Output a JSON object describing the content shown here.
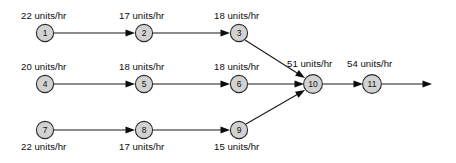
{
  "diagram": {
    "type": "process-flow-network",
    "unit_suffix": "units/hr",
    "nodes": [
      {
        "id": "n1",
        "label": "1",
        "cx": 45,
        "cy": 33,
        "r": 8.6
      },
      {
        "id": "n2",
        "label": "2",
        "cx": 144,
        "cy": 33,
        "r": 8.6
      },
      {
        "id": "n3",
        "label": "3",
        "cx": 239,
        "cy": 33,
        "r": 8.6
      },
      {
        "id": "n4",
        "label": "4",
        "cx": 45,
        "cy": 84,
        "r": 8.6
      },
      {
        "id": "n5",
        "label": "5",
        "cx": 144,
        "cy": 84,
        "r": 8.6
      },
      {
        "id": "n6",
        "label": "6",
        "cx": 239,
        "cy": 84,
        "r": 8.6
      },
      {
        "id": "n7",
        "label": "7",
        "cx": 45,
        "cy": 130,
        "r": 8.6
      },
      {
        "id": "n8",
        "label": "8",
        "cx": 144,
        "cy": 130,
        "r": 8.6
      },
      {
        "id": "n9",
        "label": "9",
        "cx": 239,
        "cy": 130,
        "r": 8.6
      },
      {
        "id": "n10",
        "label": "10",
        "cx": 313,
        "cy": 84,
        "r": 9.4
      },
      {
        "id": "n11",
        "label": "11",
        "cx": 372,
        "cy": 84,
        "r": 9.4
      }
    ],
    "edges": [
      {
        "id": "e1-2",
        "from": "n1",
        "to": "n2",
        "x1": 54,
        "y1": 33,
        "x2": 135,
        "y2": 33,
        "arrow": true
      },
      {
        "id": "e2-3",
        "from": "n2",
        "to": "n3",
        "x1": 153,
        "y1": 33,
        "x2": 230,
        "y2": 33,
        "arrow": true
      },
      {
        "id": "e3-10",
        "from": "n3",
        "to": "n10",
        "x1": 245,
        "y1": 40,
        "x2": 305,
        "y2": 78,
        "arrow": true
      },
      {
        "id": "e4-5",
        "from": "n4",
        "to": "n5",
        "x1": 54,
        "y1": 84,
        "x2": 135,
        "y2": 84,
        "arrow": true
      },
      {
        "id": "e5-6",
        "from": "n5",
        "to": "n6",
        "x1": 153,
        "y1": 84,
        "x2": 230,
        "y2": 84,
        "arrow": true
      },
      {
        "id": "e6-10",
        "from": "n6",
        "to": "n10",
        "x1": 248,
        "y1": 84,
        "x2": 304,
        "y2": 84,
        "arrow": true
      },
      {
        "id": "e7-8",
        "from": "n7",
        "to": "n8",
        "x1": 54,
        "y1": 130,
        "x2": 135,
        "y2": 130,
        "arrow": true
      },
      {
        "id": "e8-9",
        "from": "n8",
        "to": "n9",
        "x1": 153,
        "y1": 130,
        "x2": 230,
        "y2": 130,
        "arrow": true
      },
      {
        "id": "e9-10",
        "from": "n9",
        "to": "n10",
        "x1": 246,
        "y1": 124,
        "x2": 305,
        "y2": 90,
        "arrow": true
      },
      {
        "id": "e10-11",
        "from": "n10",
        "to": "n11",
        "x1": 323,
        "y1": 84,
        "x2": 363,
        "y2": 84,
        "arrow": true
      },
      {
        "id": "e11-out",
        "from": "n11",
        "to": "output",
        "x1": 382,
        "y1": 84,
        "x2": 432,
        "y2": 84,
        "arrow": true
      }
    ],
    "rate_labels": [
      {
        "id": "r1",
        "text": "22 units/hr",
        "x": 21,
        "y": 10,
        "for_node": "n1"
      },
      {
        "id": "r2",
        "text": "17 units/hr",
        "x": 119,
        "y": 10,
        "for_node": "n2"
      },
      {
        "id": "r3",
        "text": "18 units/hr",
        "x": 214,
        "y": 10,
        "for_node": "n3"
      },
      {
        "id": "r4",
        "text": "20 units/hr",
        "x": 21,
        "y": 61,
        "for_node": "n4"
      },
      {
        "id": "r5",
        "text": "18 units/hr",
        "x": 119,
        "y": 61,
        "for_node": "n5"
      },
      {
        "id": "r6",
        "text": "18 units/hr",
        "x": 214,
        "y": 61,
        "for_node": "n6"
      },
      {
        "id": "r10",
        "text": "51 units/hr",
        "x": 287,
        "y": 58,
        "for_node": "n10"
      },
      {
        "id": "r11",
        "text": "54 units/hr",
        "x": 347,
        "y": 58,
        "for_node": "n11"
      },
      {
        "id": "r7",
        "text": "22 units/hr",
        "x": 21,
        "y": 141,
        "for_node": "n7"
      },
      {
        "id": "r8",
        "text": "17 units/hr",
        "x": 119,
        "y": 141,
        "for_node": "n8"
      },
      {
        "id": "r9",
        "text": "15 units/hr",
        "x": 214,
        "y": 141,
        "for_node": "n9"
      }
    ],
    "colors": {
      "node_fill": "#d2d2d2",
      "node_stroke": "#2b2b2b",
      "edge": "#1a1a1a",
      "text": "#0d0d0d",
      "background": "#ffffff"
    }
  }
}
